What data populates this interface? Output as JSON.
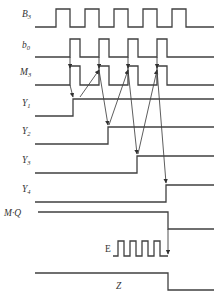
{
  "diagram": {
    "colors": {
      "background": "#ffffff",
      "line": "#404040",
      "label": "#333333"
    },
    "geometry": {
      "width": 222,
      "height": 298,
      "wave_start_x": 35,
      "wave_end_x": 214,
      "stroke_width": 1.3
    },
    "signals": [
      {
        "name": "B",
        "subscript": "3",
        "label_upright": false,
        "label_x": 22,
        "label_y": 17,
        "baseline_y": 27,
        "high_y": 9,
        "type": "pulse-train",
        "start_x": 35,
        "end_x": 214,
        "pulses": [
          {
            "rise": 56,
            "fall": 70
          },
          {
            "rise": 85,
            "fall": 99
          },
          {
            "rise": 114,
            "fall": 128
          },
          {
            "rise": 143,
            "fall": 157
          },
          {
            "rise": 172,
            "fall": 186
          }
        ]
      },
      {
        "name": "b",
        "subscript": "0",
        "label_upright": false,
        "label_x": 22,
        "label_y": 48,
        "baseline_y": 57,
        "high_y": 39,
        "type": "pulse-train",
        "start_x": 35,
        "end_x": 214,
        "pulses": [
          {
            "rise": 70,
            "fall": 80
          },
          {
            "rise": 99,
            "fall": 109
          },
          {
            "rise": 128,
            "fall": 138
          },
          {
            "rise": 157,
            "fall": 167
          }
        ]
      },
      {
        "name": "M",
        "subscript": "3",
        "label_upright": false,
        "label_x": 20,
        "label_y": 75,
        "baseline_y": 85,
        "high_y": 66,
        "type": "pulse-train",
        "start_x": 35,
        "end_x": 214,
        "pulses": [
          {
            "rise": 70,
            "fall": 80
          },
          {
            "rise": 99,
            "fall": 109
          },
          {
            "rise": 128,
            "fall": 138
          },
          {
            "rise": 157,
            "fall": 167
          }
        ]
      },
      {
        "name": "Y",
        "subscript": "1",
        "label_upright": false,
        "label_x": 22,
        "label_y": 106,
        "baseline_y": 116,
        "high_y": 99,
        "type": "step-up",
        "start_x": 35,
        "end_x": 214,
        "rise": 73
      },
      {
        "name": "Y",
        "subscript": "2",
        "label_upright": false,
        "label_x": 22,
        "label_y": 134,
        "baseline_y": 144,
        "high_y": 127,
        "type": "step-up",
        "start_x": 35,
        "end_x": 214,
        "rise": 108
      },
      {
        "name": "Y",
        "subscript": "3",
        "label_upright": false,
        "label_x": 22,
        "label_y": 163,
        "baseline_y": 173,
        "high_y": 156,
        "type": "step-up",
        "start_x": 35,
        "end_x": 214,
        "rise": 137
      },
      {
        "name": "Y",
        "subscript": "4",
        "label_upright": false,
        "label_x": 22,
        "label_y": 192,
        "baseline_y": 202,
        "high_y": 185,
        "type": "step-up",
        "start_x": 35,
        "end_x": 214,
        "rise": 166
      },
      {
        "name": "M·Q",
        "subscript": "",
        "label_upright": false,
        "label_x": 4,
        "label_y": 216,
        "baseline_y": 229,
        "high_y": 212,
        "type": "step-down",
        "start_x": 38,
        "end_x": 214,
        "fall": 168
      },
      {
        "name": "E",
        "subscript": "",
        "label_upright": true,
        "label_x": 105,
        "label_y": 252,
        "baseline_y": 256,
        "high_y": 241,
        "type": "pulse-train",
        "start_x": 113,
        "end_x": 168,
        "pulses": [
          {
            "rise": 118,
            "fall": 124
          },
          {
            "rise": 130,
            "fall": 136
          },
          {
            "rise": 142,
            "fall": 148
          },
          {
            "rise": 154,
            "fall": 160
          }
        ]
      },
      {
        "name": "Z",
        "subscript": "",
        "label_upright": false,
        "label_x": 116,
        "label_y": 289,
        "baseline_y": 290,
        "high_y": 273,
        "type": "step-down",
        "start_x": 35,
        "end_x": 214,
        "fall": 168
      }
    ],
    "clock_arrows": [
      {
        "x": 70,
        "y1": 57,
        "y2": 68
      },
      {
        "x": 99,
        "y1": 57,
        "y2": 68
      },
      {
        "x": 128,
        "y1": 57,
        "y2": 68
      },
      {
        "x": 157,
        "y1": 57,
        "y2": 68
      }
    ],
    "causal_arrows": [
      {
        "x1": 70,
        "y1": 85,
        "x2": 73,
        "y2": 97,
        "label": "M-to-Y1"
      },
      {
        "x1": 80,
        "y1": 97,
        "x2": 99,
        "y2": 70,
        "label": "Y1-to-M2"
      },
      {
        "x1": 99,
        "y1": 70,
        "x2": 108,
        "y2": 125,
        "label": "M2-to-Y2"
      },
      {
        "x1": 109,
        "y1": 125,
        "x2": 128,
        "y2": 70,
        "label": "Y2-to-M3"
      },
      {
        "x1": 128,
        "y1": 70,
        "x2": 137,
        "y2": 154,
        "label": "M3-to-Y3"
      },
      {
        "x1": 138,
        "y1": 154,
        "x2": 157,
        "y2": 70,
        "label": "Y3-to-M4"
      },
      {
        "x1": 157,
        "y1": 70,
        "x2": 166,
        "y2": 183,
        "label": "M4-to-Y4"
      }
    ],
    "drop_arrows": [
      {
        "x": 168,
        "y1": 229,
        "y2": 254,
        "label": "MQ-to-E"
      }
    ]
  }
}
